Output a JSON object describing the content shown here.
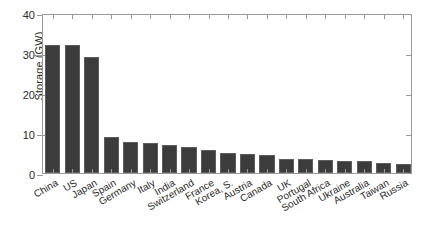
{
  "chart_data": {
    "type": "bar",
    "title": "",
    "xlabel": "",
    "ylabel": "Storage (GW)",
    "ylim": [
      0,
      40
    ],
    "yticks": [
      0,
      10,
      20,
      30,
      40
    ],
    "ytick_labels": [
      "0",
      "10",
      "20",
      "30",
      "40"
    ],
    "grid": false,
    "legend": null,
    "bar_color": "#3c3c3c",
    "axis_color": "#9a9a9a",
    "text_color": "#2b2b2b",
    "background": "#ffffff",
    "xtick_rotation": -30,
    "categories": [
      "China",
      "US",
      "Japan",
      "Spain",
      "Germany",
      "Italy",
      "India",
      "Switzerland",
      "France",
      "Korea, S.",
      "Austria",
      "Canada",
      "UK",
      "Portugal",
      "South Africa",
      "Ukraine",
      "Australia",
      "Taiwan",
      "Russia"
    ],
    "values": [
      32,
      32,
      29,
      9,
      7.8,
      7.6,
      7,
      6.4,
      5.8,
      4.9,
      4.7,
      4.5,
      3.5,
      3.4,
      3.2,
      3,
      2.9,
      2.6,
      2.2
    ]
  }
}
